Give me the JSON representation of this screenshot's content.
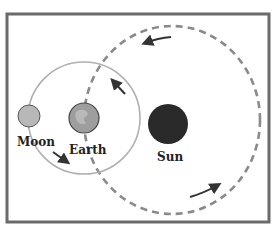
{
  "diagram": {
    "labels": {
      "moon": "Moon",
      "earth": "Earth",
      "sun": "Sun"
    },
    "colors": {
      "frame": "#6b6b6b",
      "moon_orbit": "#b0b0b0",
      "earth_orbit": "#8a8a8a",
      "moon": "#b8b8b8",
      "earth": "#9a9a9a",
      "sun": "#2a2a2a",
      "arrow": "#333333"
    },
    "bodies": [
      {
        "name": "Moon",
        "cx": 29,
        "cy": 116,
        "r": 11
      },
      {
        "name": "Earth",
        "cx": 84,
        "cy": 118,
        "r": 15
      },
      {
        "name": "Sun",
        "cx": 168,
        "cy": 124,
        "r": 20
      }
    ],
    "orbits": [
      {
        "name": "moon-orbit",
        "style": "solid",
        "cx": 84,
        "cy": 118,
        "r": 56
      },
      {
        "name": "earth-orbit",
        "style": "dashed",
        "cx": 172,
        "cy": 120,
        "rx": 88,
        "ry": 95
      }
    ]
  }
}
